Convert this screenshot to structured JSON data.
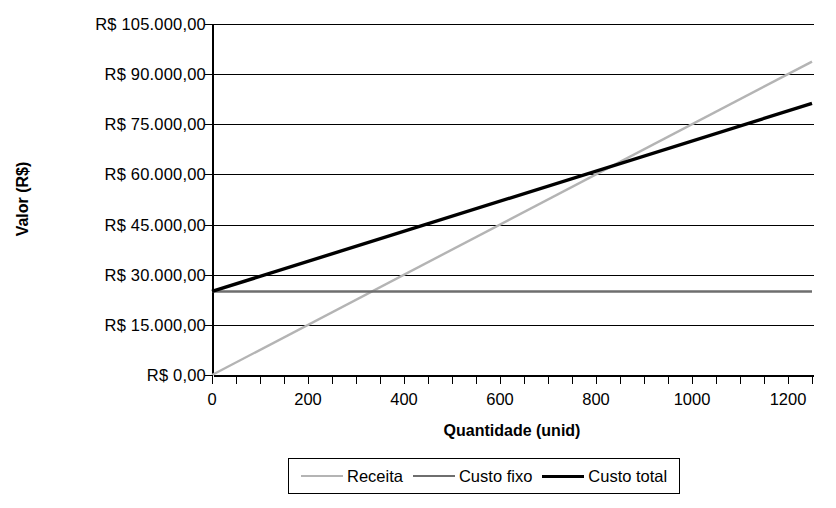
{
  "chart_data": {
    "type": "line",
    "title": "",
    "xlabel": "Quantidade (unid)",
    "ylabel": "Valor (R$)",
    "xlim": [
      0,
      1250
    ],
    "ylim": [
      0,
      105000
    ],
    "grid": true,
    "legend_position": "bottom",
    "x_ticks": [
      0,
      200,
      400,
      600,
      800,
      1000,
      1200
    ],
    "x_tick_labels": [
      "0",
      "200",
      "400",
      "600",
      "800",
      "1000",
      "1200"
    ],
    "x_minor_tick_step": 50,
    "y_ticks": [
      0,
      15000,
      30000,
      45000,
      60000,
      75000,
      90000,
      105000
    ],
    "y_tick_labels": [
      "R$ 0,00",
      "R$ 15.000,00",
      "R$ 30.000,00",
      "R$ 45.000,00",
      "R$ 60.000,00",
      "R$ 75.000,00",
      "R$ 90.000,00",
      "R$ 105.000,00"
    ],
    "x": [
      0,
      1250
    ],
    "series": [
      {
        "name": "Receita",
        "color": "#b4b4b4",
        "width": 2.4,
        "values": [
          0,
          93750
        ]
      },
      {
        "name": "Custo fixo",
        "color": "#6e6e6e",
        "width": 2.4,
        "values": [
          25000,
          25000
        ]
      },
      {
        "name": "Custo total",
        "color": "#000000",
        "width": 3.4,
        "values": [
          25000,
          81250
        ]
      }
    ],
    "annotations": []
  },
  "legend": {
    "items": [
      {
        "label": "Receita",
        "color": "#b4b4b4",
        "width": 2.4
      },
      {
        "label": "Custo fixo",
        "color": "#6e6e6e",
        "width": 2.6
      },
      {
        "label": "Custo total",
        "color": "#000000",
        "width": 3.6
      }
    ]
  }
}
